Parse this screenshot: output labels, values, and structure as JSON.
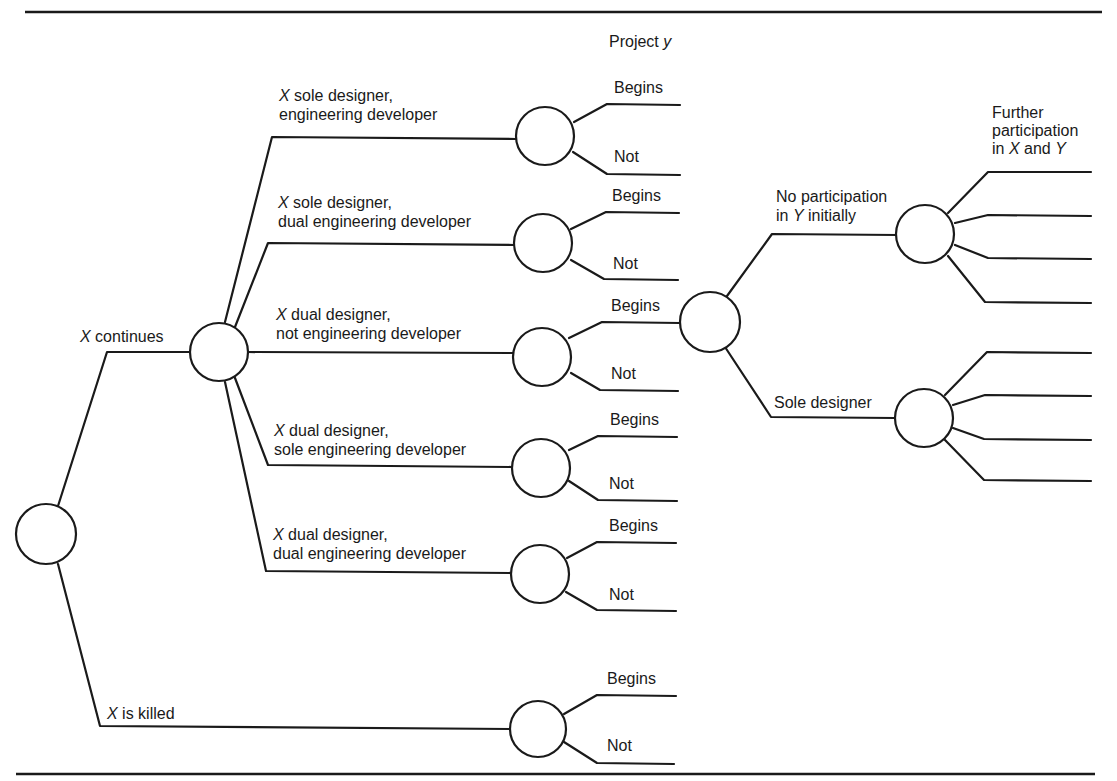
{
  "title": {
    "prefix": "Project ",
    "var": "y"
  },
  "root": {
    "branches": {
      "continues": {
        "var": "X",
        "text": " continues"
      },
      "killed": {
        "var": "X",
        "text": " is killed"
      }
    }
  },
  "options": [
    {
      "var": "X",
      "line1": " sole designer,",
      "line2": "engineering developer"
    },
    {
      "var": "X",
      "line1": " sole designer,",
      "line2": "dual engineering developer"
    },
    {
      "var": "X",
      "line1": " dual designer,",
      "line2": "not engineering developer"
    },
    {
      "var": "X",
      "line1": " dual designer,",
      "line2": "sole engineering developer"
    },
    {
      "var": "X",
      "line1": " dual designer,",
      "line2": "dual engineering developer"
    }
  ],
  "outcomes": {
    "begins": "Begins",
    "not": "Not"
  },
  "project_y": {
    "no_participation": {
      "line1": "No participation",
      "line2_prefix": "in ",
      "line2_var": "Y",
      "line2_suffix": " initially"
    },
    "sole_designer": "Sole designer",
    "further": {
      "line1": "Further",
      "line2": "participation",
      "line3_prefix": "in ",
      "line3_var1": "X",
      "line3_mid": " and ",
      "line3_var2": "Y"
    }
  },
  "colors": {
    "ink": "#1a1a1a",
    "paper": "#ffffff"
  }
}
